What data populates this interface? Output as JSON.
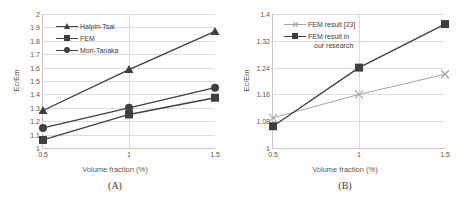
{
  "figure": {
    "background_color": "#ffffff",
    "text_color": "#595959"
  },
  "panels": [
    {
      "id": "A",
      "caption": "(A)",
      "xlabel": "Volume fraction (%)",
      "ylabel": "Ec/Em",
      "xticks": [
        "0.5",
        "1",
        "1.5"
      ],
      "yticks": [
        "1",
        "1.1",
        "1.2",
        "1.3",
        "1.4",
        "1.5",
        "1.6",
        "1.7",
        "1.8",
        "1.9",
        "2"
      ],
      "legend": [
        {
          "label": "Halpin-Tsai",
          "marker": "triangle",
          "color": "#3f3f3f"
        },
        {
          "label": "FEM",
          "marker": "square",
          "color": "#3f3f3f"
        },
        {
          "label": "Mori-Tanaka",
          "marker": "circle",
          "color": "#3f3f3f"
        }
      ]
    },
    {
      "id": "B",
      "caption": "(B)",
      "xlabel": "Volume fraction (%)",
      "ylabel": "Ec/Em",
      "xticks": [
        "0.5",
        "1",
        "1.5"
      ],
      "yticks": [
        "1",
        "1.08",
        "1.16",
        "1.24",
        "1.32",
        "1.4"
      ],
      "legend": [
        {
          "label": "FEM result [23]",
          "label_line2": "",
          "marker": "x",
          "color": "#a6a6a6"
        },
        {
          "label": "FEM result in",
          "label_line2": "our research",
          "marker": "square",
          "color": "#3f3f3f"
        }
      ]
    }
  ],
  "chart_data": [
    {
      "type": "line",
      "panel": "A",
      "title": "(A)",
      "xlabel": "Volume fraction (%)",
      "ylabel": "Ec/Em",
      "x": [
        0.5,
        1,
        1.5
      ],
      "xlim": [
        0.5,
        1.5
      ],
      "ylim": [
        1,
        2
      ],
      "ytick_step": 0.1,
      "grid": true,
      "legend_position": "upper-left-inside",
      "series": [
        {
          "name": "Halpin-Tsai",
          "marker": "triangle",
          "color": "#3f3f3f",
          "values": [
            1.28,
            1.585,
            1.87
          ]
        },
        {
          "name": "FEM",
          "marker": "square",
          "color": "#3f3f3f",
          "values": [
            1.06,
            1.25,
            1.375
          ]
        },
        {
          "name": "Mori-Tanaka",
          "marker": "circle",
          "color": "#3f3f3f",
          "values": [
            1.15,
            1.3,
            1.45
          ]
        }
      ]
    },
    {
      "type": "line",
      "panel": "B",
      "title": "(B)",
      "xlabel": "Volume fraction (%)",
      "ylabel": "Ec/Em",
      "x": [
        0.5,
        1,
        1.5
      ],
      "xlim": [
        0.5,
        1.5
      ],
      "ylim": [
        1,
        1.4
      ],
      "ytick_step": 0.08,
      "grid": true,
      "legend_position": "upper-left-inside",
      "series": [
        {
          "name": "FEM result [23]",
          "marker": "x",
          "color": "#a6a6a6",
          "values": [
            1.09,
            1.16,
            1.22
          ]
        },
        {
          "name": "FEM result in our research",
          "marker": "square",
          "color": "#3f3f3f",
          "values": [
            1.065,
            1.24,
            1.37
          ]
        }
      ]
    }
  ]
}
